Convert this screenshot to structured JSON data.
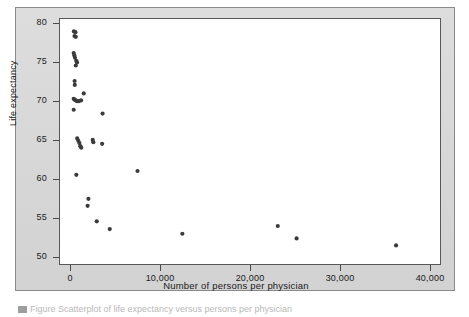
{
  "figure": {
    "background_color": "#d9d9d9",
    "plot_background_color": "#ffffff",
    "frame_color": "#585858",
    "marker_color": "#3b3b3b"
  },
  "caption_artifact": "Figure  Scatterplot of life expectancy versus persons per physician",
  "axes": {
    "y": {
      "title": "Life expectancy",
      "ticks": [
        {
          "value": 80,
          "label": "80"
        },
        {
          "value": 75,
          "label": "75"
        },
        {
          "value": 70,
          "label": "70"
        },
        {
          "value": 65,
          "label": "65"
        },
        {
          "value": 60,
          "label": "60"
        },
        {
          "value": 55,
          "label": "55"
        },
        {
          "value": 50,
          "label": "50"
        }
      ]
    },
    "x": {
      "title": "Number of persons per physician",
      "ticks": [
        {
          "value": 0,
          "label": "0"
        },
        {
          "value": 10000,
          "label": "10,000"
        },
        {
          "value": 20000,
          "label": "20,000"
        },
        {
          "value": 30000,
          "label": "30,000"
        },
        {
          "value": 40000,
          "label": "40,000"
        }
      ]
    }
  },
  "chart_data": {
    "type": "scatter",
    "title": "",
    "xlabel": "Number of persons per physician",
    "ylabel": "Life expectancy",
    "xlim": [
      -1200,
      41200
    ],
    "ylim": [
      49.0,
      80.6
    ],
    "grid": false,
    "legend": null,
    "marker": {
      "shape": "circle",
      "size_px": 4.2,
      "color": "#3b3b3b"
    },
    "points": [
      {
        "x": 350,
        "y": 79.0
      },
      {
        "x": 520,
        "y": 78.9
      },
      {
        "x": 420,
        "y": 78.4
      },
      {
        "x": 560,
        "y": 78.3
      },
      {
        "x": 330,
        "y": 76.2
      },
      {
        "x": 400,
        "y": 75.9
      },
      {
        "x": 470,
        "y": 75.6
      },
      {
        "x": 610,
        "y": 75.2
      },
      {
        "x": 700,
        "y": 75.0
      },
      {
        "x": 560,
        "y": 74.6
      },
      {
        "x": 430,
        "y": 72.6
      },
      {
        "x": 450,
        "y": 72.1
      },
      {
        "x": 1450,
        "y": 71.0
      },
      {
        "x": 330,
        "y": 70.3
      },
      {
        "x": 430,
        "y": 70.2
      },
      {
        "x": 560,
        "y": 70.1
      },
      {
        "x": 700,
        "y": 70.0
      },
      {
        "x": 900,
        "y": 70.0
      },
      {
        "x": 1150,
        "y": 70.1
      },
      {
        "x": 330,
        "y": 68.9
      },
      {
        "x": 3550,
        "y": 68.4
      },
      {
        "x": 720,
        "y": 65.2
      },
      {
        "x": 840,
        "y": 64.9
      },
      {
        "x": 960,
        "y": 64.6
      },
      {
        "x": 1070,
        "y": 64.2
      },
      {
        "x": 1170,
        "y": 64.0
      },
      {
        "x": 2450,
        "y": 65.0
      },
      {
        "x": 2520,
        "y": 64.7
      },
      {
        "x": 3500,
        "y": 64.5
      },
      {
        "x": 620,
        "y": 60.5
      },
      {
        "x": 7450,
        "y": 61.0
      },
      {
        "x": 1970,
        "y": 57.4
      },
      {
        "x": 1880,
        "y": 56.5
      },
      {
        "x": 2900,
        "y": 54.5
      },
      {
        "x": 4350,
        "y": 53.5
      },
      {
        "x": 12450,
        "y": 52.9
      },
      {
        "x": 23100,
        "y": 53.9
      },
      {
        "x": 25200,
        "y": 52.3
      },
      {
        "x": 36300,
        "y": 51.4
      }
    ]
  }
}
